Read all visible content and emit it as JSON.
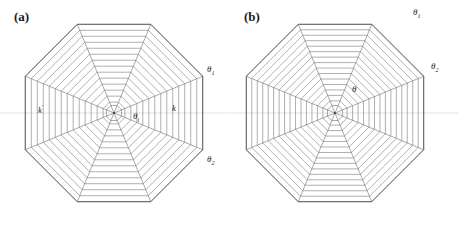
{
  "figure": {
    "background": "#ffffff",
    "line_color": "#6e6e6e",
    "outline_color": "#4a4a4a",
    "axis_color": "#cfcfcf",
    "text_color": "#2a2a2a"
  },
  "panels": [
    {
      "id": "a",
      "tag": "(a)",
      "tag_x": 14,
      "tag_y": 10,
      "center_x": 114,
      "center_y": 113,
      "radius": 96,
      "sectors": 8,
      "rotation_deg": 22.5,
      "lines_per_sector": 14,
      "inner_radius_frac": 0.055,
      "labels": [
        {
          "name": "theta-1",
          "base": "θ",
          "sub": "1",
          "sup": "",
          "x": 207,
          "y": 65
        },
        {
          "name": "theta-2",
          "base": "θ",
          "sub": "2",
          "sup": "",
          "x": 207,
          "y": 155
        },
        {
          "name": "k-right",
          "base": "k",
          "sub": "",
          "sup": "",
          "x": 172,
          "y": 104
        },
        {
          "name": "k-prime-left",
          "base": "k",
          "sub": "",
          "sup": "′",
          "x": 38,
          "y": 104
        },
        {
          "name": "theta-center",
          "base": "θ",
          "sub": "i",
          "sup": "",
          "x": 133,
          "y": 112
        }
      ]
    },
    {
      "id": "b",
      "tag": "(b)",
      "tag_x": 14,
      "tag_y": 10,
      "center_x": 105,
      "center_y": 113,
      "radius": 96,
      "sectors": 8,
      "rotation_deg": 22.5,
      "lines_per_sector": 15,
      "inner_radius_frac": 0.075,
      "labels": [
        {
          "name": "theta-1",
          "base": "θ",
          "sub": "1",
          "sup": "",
          "x": 183,
          "y": 8
        },
        {
          "name": "theta-2",
          "base": "θ",
          "sub": "2",
          "sup": "",
          "x": 201,
          "y": 62
        },
        {
          "name": "theta-center",
          "base": "θ",
          "sub": "",
          "sup": "",
          "x": 122,
          "y": 85
        }
      ]
    }
  ]
}
